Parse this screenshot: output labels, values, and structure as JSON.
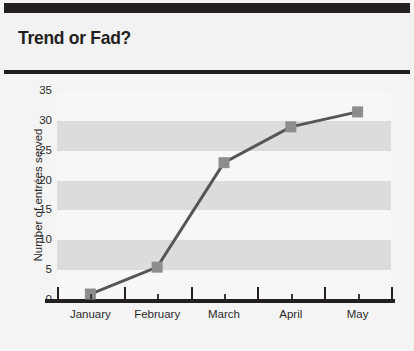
{
  "header": {
    "title": "Trend or Fad?"
  },
  "chart_data": {
    "type": "line",
    "title": "Trend or Fad?",
    "xlabel": "",
    "ylabel": "Number of entrées served",
    "categories": [
      "January",
      "February",
      "March",
      "April",
      "May"
    ],
    "values": [
      1,
      5.5,
      23,
      29,
      31.5
    ],
    "series": [
      {
        "name": "Number of entrées served",
        "values": [
          1,
          5.5,
          23,
          29,
          31.5
        ]
      }
    ],
    "ylim": [
      0,
      35
    ],
    "ytick_labels": [
      "0",
      "5",
      "10",
      "15",
      "20",
      "25",
      "30",
      "35"
    ],
    "ytick_values": [
      0,
      5,
      10,
      15,
      20,
      25,
      30,
      35
    ],
    "grid": "alternating-horizontal-bands",
    "legend": "none",
    "marker": "square",
    "colors": {
      "line": "#56565a",
      "marker": "#8d8d8d",
      "band_dark": "#dcdcdc",
      "band_light": "#f7f7f7",
      "axis": "#231f20",
      "text": "#2b2b2b",
      "background": "#f4f4f4"
    }
  }
}
